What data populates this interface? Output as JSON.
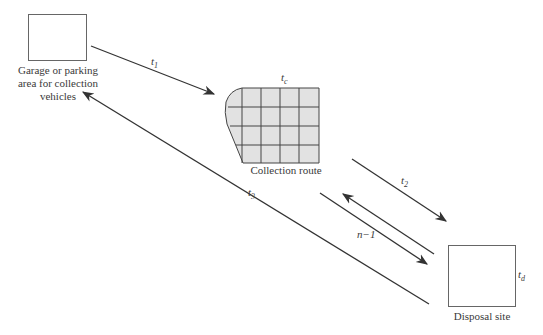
{
  "diagram": {
    "type": "flow",
    "nodes": {
      "garage": {
        "label": "Garage or parking area for collection vehicles",
        "lines": [
          "Garage or parking",
          "area for collection",
          "vehicles"
        ]
      },
      "route": {
        "label": "Collection route",
        "time_var": "t",
        "time_sub": "c"
      },
      "disposal": {
        "label": "Disposal site",
        "time_var": "t",
        "time_sub": "d"
      }
    },
    "edges": [
      {
        "id": "t1",
        "from": "garage",
        "to": "route",
        "var": "t",
        "sub": "1"
      },
      {
        "id": "t2",
        "from": "route",
        "to": "disposal",
        "var": "t",
        "sub": "2"
      },
      {
        "id": "t3",
        "from": "disposal",
        "to": "garage",
        "var": "t",
        "sub": "3"
      },
      {
        "id": "n-1",
        "from": "route",
        "to": "disposal",
        "label": "n−1",
        "bidirectional": true
      }
    ]
  }
}
